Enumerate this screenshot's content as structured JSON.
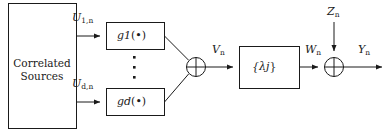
{
  "diagram": {
    "type": "block-diagram",
    "title": "",
    "blocks": [
      {
        "id": "source",
        "label_line1": "Correlated",
        "label_line2": "Sources",
        "x": 8,
        "y": 3,
        "w": 68,
        "h": 125
      },
      {
        "id": "g1",
        "label": "g",
        "label_sub": "1",
        "label_arg": "(•)",
        "x": 106,
        "y": 22,
        "w": 58,
        "h": 27
      },
      {
        "id": "gd",
        "label": "g",
        "label_sub": "d",
        "label_arg": "(•)",
        "x": 106,
        "y": 88,
        "w": 58,
        "h": 27
      },
      {
        "id": "lambda",
        "label": "{λ",
        "label_sub": "j",
        "label_close": "}",
        "x": 239,
        "y": 46,
        "w": 60,
        "h": 42
      }
    ],
    "adders": [
      {
        "id": "adder-v",
        "symbol": "⊕",
        "cx": 196,
        "cy": 67,
        "r": 10
      },
      {
        "id": "adder-y",
        "symbol": "⊕",
        "cx": 334,
        "cy": 67,
        "r": 10
      }
    ],
    "signals": [
      {
        "id": "u1",
        "base": "U",
        "sub": "1,n",
        "x": 72,
        "y": 12
      },
      {
        "id": "ud",
        "base": "U",
        "sub": "d,n",
        "x": 72,
        "y": 78
      },
      {
        "id": "v",
        "base": "V",
        "sub": "n",
        "x": 212,
        "y": 44
      },
      {
        "id": "w",
        "base": "W",
        "sub": "n",
        "x": 305,
        "y": 44
      },
      {
        "id": "z",
        "base": "Z",
        "sub": "n",
        "x": 327,
        "y": 8
      },
      {
        "id": "y",
        "base": "Y",
        "sub": "n",
        "x": 358,
        "y": 44
      }
    ],
    "ellipsis": {
      "id": "vertical-dots",
      "glyph": "⋮",
      "count": 3,
      "x": 134,
      "y": 55
    }
  }
}
